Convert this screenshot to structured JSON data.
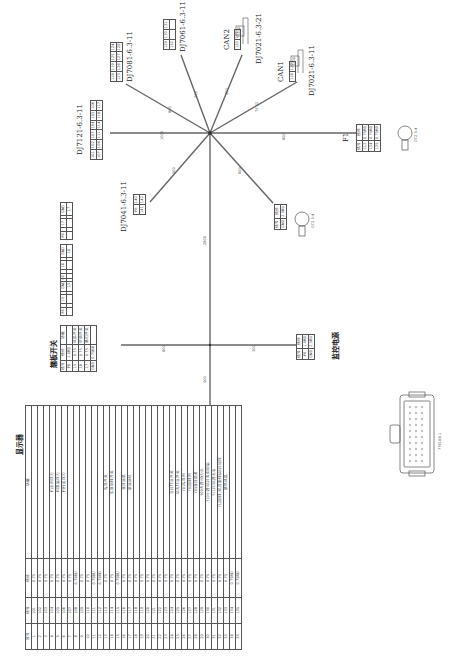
{
  "orientation": "rotated -90deg",
  "hub": {
    "x": 210,
    "y": 133
  },
  "branches": [
    {
      "name": "DJ7121-6.3-11",
      "length": "1000"
    },
    {
      "name": "DJ7081-6.3-11",
      "length": "800"
    },
    {
      "name": "DJ7061-6.3-11",
      "length": "300"
    },
    {
      "name": "CAN2",
      "length": "200"
    },
    {
      "name": "CAN1",
      "length": "75.22"
    },
    {
      "name": "F1",
      "length": "800"
    },
    {
      "name": "DJ7041-6.3-11",
      "length": "500"
    },
    {
      "name": "GND",
      "length": "600"
    },
    {
      "name": "trunk",
      "length": "2800"
    },
    {
      "name": "base-switch",
      "length": "800"
    },
    {
      "name": "monitor-power",
      "length": "300"
    },
    {
      "name": "display",
      "length": "500"
    }
  ],
  "connectors": {
    "dj7121": {
      "label": "DJ7121-6.3-11",
      "rows": [
        [
          "101",
          "102",
          "103",
          "104",
          "105",
          "106"
        ],
        [
          "107",
          "108",
          "111",
          "114",
          "116",
          "117"
        ]
      ]
    },
    "dj7081": {
      "label": "DJ7081-6.3-11",
      "rows": [
        [
          "118",
          "119",
          "125",
          "124"
        ],
        [
          "123",
          "126",
          "127",
          "128"
        ]
      ]
    },
    "dj7061": {
      "label": "DJ7061-6.3-11",
      "rows": [
        [
          "129",
          "130",
          "131"
        ],
        [
          "132",
          "",
          ""
        ]
      ]
    },
    "can2": {
      "label": "CAN2",
      "model": "DJ7021-6.3-21",
      "pins": [
        "120",
        "121"
      ],
      "resistor": "120Ω"
    },
    "can1": {
      "label": "CAN1",
      "model": "DJ7021-6.3-11",
      "pins": [
        "118",
        "122"
      ],
      "resistor": "120Ω"
    },
    "dj7041": {
      "label": "DJ7041-6.3-11",
      "rows": [
        [
          "F6",
          "140"
        ],
        [
          "141",
          "142"
        ]
      ]
    }
  },
  "f1": {
    "label": "F1",
    "headers": [
      "线号",
      "线径"
    ],
    "rows": [
      [
        "112",
        "0.75RD"
      ],
      [
        "134",
        "0.75RD"
      ],
      [
        "135",
        "0.75RD"
      ]
    ],
    "terminal": "OT2.5-4"
  },
  "gnd_terminal": {
    "headers": [
      "线号",
      "线径"
    ],
    "rows": [
      [
        "GND",
        "2.5BU"
      ]
    ],
    "terminal": "OT2.5-4"
  },
  "switch_connectors": [
    {
      "pins": [
        "F6",
        "",
        "17",
        "17",
        "GND"
      ]
    },
    {
      "pins": [
        "F6",
        "",
        "16",
        "16",
        "GND"
      ]
    },
    {
      "pins": [
        "F6",
        "",
        "15",
        "15",
        "GND"
      ]
    }
  ],
  "base_switch": {
    "title": "翘板开关",
    "headers": [
      "线号",
      "线径",
      "功能"
    ],
    "rows": [
      [
        "F6",
        "1.0RD",
        ""
      ],
      [
        "15",
        "0.75",
        "风扇开关"
      ],
      [
        "16",
        "0.75",
        "空调开关"
      ],
      [
        "17",
        "0.75",
        "暴闪开关"
      ],
      [
        "GND",
        "0.75BU",
        ""
      ]
    ]
  },
  "monitor_power": {
    "title": "监控电源",
    "headers": [
      "线号",
      "线径"
    ],
    "rows": [
      [
        "F6",
        "1.0RD"
      ],
      [
        "GND",
        "2.5BU"
      ]
    ]
  },
  "display": {
    "title": "显示器",
    "headers": [
      "序号",
      "线号",
      "线径",
      "功能"
    ],
    "rows": [
      [
        "1",
        "101",
        "0.75",
        ""
      ],
      [
        "2",
        "102",
        "0.75",
        ""
      ],
      [
        "3",
        "103",
        "0.75",
        ""
      ],
      [
        "4",
        "104",
        "0.75",
        "P1主阀压力"
      ],
      [
        "5",
        "105",
        "0.75",
        "P2泵后压力"
      ],
      [
        "6",
        "106",
        "0.75",
        "P3行走压力"
      ],
      [
        "7",
        "107",
        "0.75",
        ""
      ],
      [
        "8",
        "108",
        "0.75BU",
        ""
      ],
      [
        "9",
        "109",
        "0.75",
        ""
      ],
      [
        "10",
        "110",
        "0.75",
        ""
      ],
      [
        "11",
        "111",
        "0.75BU",
        ""
      ],
      [
        "12",
        "112",
        "0.75RD",
        ""
      ],
      [
        "13",
        "113",
        "0.75",
        "先导开关"
      ],
      [
        "14",
        "114",
        "0.75",
        "车身回转开关"
      ],
      [
        "15",
        "115",
        "0.75BU",
        ""
      ],
      [
        "16",
        "116",
        "0.75",
        "液压油温"
      ],
      [
        "17",
        "117",
        "0.75",
        "柴油油位"
      ],
      [
        "18",
        "118",
        "0.75",
        ""
      ],
      [
        "19",
        "119",
        "0.75",
        ""
      ],
      [
        "20",
        "120",
        "0.75",
        ""
      ],
      [
        "21",
        "121",
        "0.75",
        ""
      ],
      [
        "22",
        "122",
        "0.75",
        ""
      ],
      [
        "23",
        "123",
        "0.75",
        ""
      ],
      [
        "24",
        "124",
        "0.75",
        "立杆作业开关"
      ],
      [
        "25",
        "125",
        "0.75",
        "钻孔作业开关"
      ],
      [
        "26",
        "126",
        "0.75",
        "Y01先导阀"
      ],
      [
        "27",
        "127",
        "0.75",
        "Y02回转阀"
      ],
      [
        "28",
        "128",
        "0.75",
        "Y05液压锁紧"
      ],
      [
        "29",
        "129",
        "0.75",
        "Y09大臂/动力头"
      ],
      [
        "30",
        "130",
        "0.75",
        "Y10小臂/钻杆夹钳前后"
      ],
      [
        "31",
        "131",
        "0.75",
        "Y11杆/钻臂左右"
      ],
      [
        "32",
        "132",
        "0.75",
        "Y12回转/机具旋转&钻杆加压"
      ],
      [
        "33",
        "133",
        "0.75",
        "散热风扇"
      ],
      [
        "34",
        "134",
        "0.75RD",
        ""
      ],
      [
        "35",
        "135",
        "0.75RD",
        ""
      ]
    ]
  },
  "plug": {
    "label": "776164-1"
  }
}
